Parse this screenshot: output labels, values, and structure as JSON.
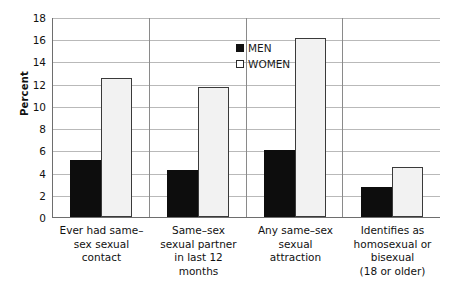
{
  "chart_data": {
    "type": "bar",
    "title": "",
    "xlabel": "",
    "ylabel": "Percent",
    "ylim": [
      0,
      18
    ],
    "ytick_step": 2,
    "yticks": [
      18,
      16,
      14,
      12,
      10,
      8,
      6,
      4,
      2,
      0
    ],
    "grid": true,
    "legend_position": "top-center",
    "categories": [
      "Ever had same-sex sexual contact",
      "Same-sex sexual partner in last 12 months",
      "Any same-sex sexual attraction",
      "Identifies as homosexual or bisexual (18 or older)"
    ],
    "category_lines": [
      [
        "Ever had same–",
        "sex sexual",
        "contact"
      ],
      [
        "Same–sex",
        "sexual partner",
        "in last 12",
        "months"
      ],
      [
        "Any same–sex",
        "sexual",
        "attraction"
      ],
      [
        "Identifies as",
        "homosexual or",
        "bisexual",
        "(18 or older)"
      ]
    ],
    "series": [
      {
        "name": "MEN",
        "color": "#0d0d0d",
        "values": [
          5.1,
          4.2,
          6.0,
          2.7
        ]
      },
      {
        "name": "WOMEN",
        "color": "#f2f2f2",
        "values": [
          12.5,
          11.7,
          16.1,
          4.5
        ]
      }
    ]
  },
  "legend": {
    "men_label": "MEN",
    "women_label": "WOMEN"
  },
  "axis": {
    "y_title": "Percent",
    "t18": "18",
    "t16": "16",
    "t14": "14",
    "t12": "12",
    "t10": "10",
    "t8": "8",
    "t6": "6",
    "t4": "4",
    "t2": "2",
    "t0": "0"
  },
  "categories_text": {
    "c0l0": "Ever had same–",
    "c0l1": "sex sexual",
    "c0l2": "contact",
    "c1l0": "Same–sex",
    "c1l1": "sexual partner",
    "c1l2": "in last 12",
    "c1l3": "months",
    "c2l0": "Any same–sex",
    "c2l1": "sexual",
    "c2l2": "attraction",
    "c3l0": "Identifies as",
    "c3l1": "homosexual or",
    "c3l2": "bisexual",
    "c3l3": "(18 or older)"
  }
}
